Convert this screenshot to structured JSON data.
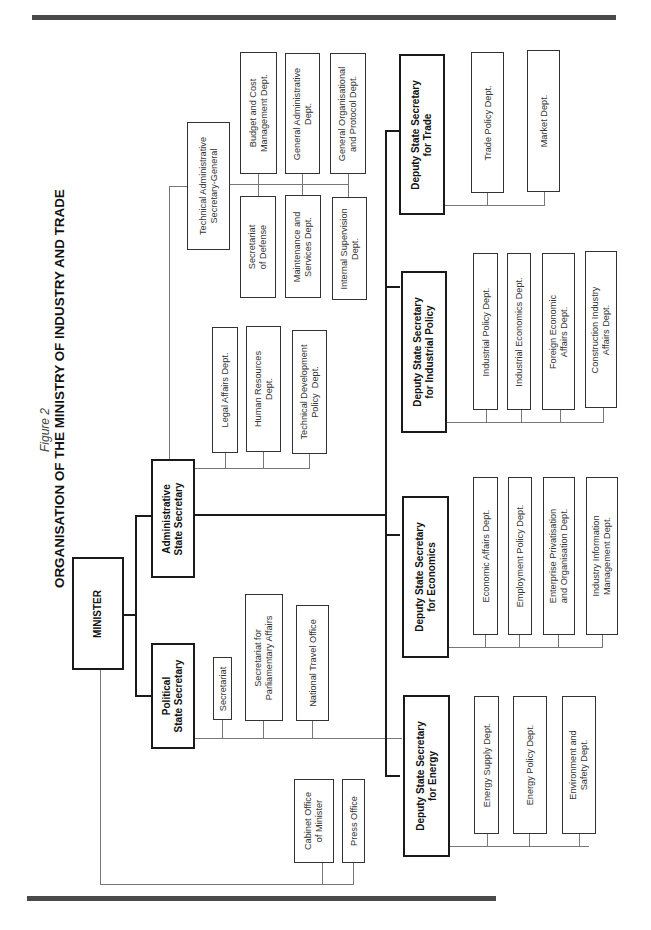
{
  "figure_label": "Figure 2",
  "title": "ORGANISATION OF THE MINISTRY OF INDUSTRY AND TRADE",
  "orientation": "rotated 90° counter-clockwise (landscape page)",
  "org": {
    "minister": "MINISTER",
    "minister_offices": [
      "Cabinet Office\nof Minister",
      "Press Office"
    ],
    "political_state_secretary": {
      "label": "Political\nState Secretary",
      "units": [
        "Secretariat",
        "Secretariat for\nParliamentary Affairs",
        "National Travel Office"
      ]
    },
    "administrative_state_secretary": {
      "label": "Administrative\nState Secretary",
      "units": [
        "Legal Affairs Dept.",
        "Human Resources\nDept.",
        "Technical Development\nPolicy  Dept."
      ],
      "technical_admin_sg": {
        "label": "Technical Administrative\nSecretary-General",
        "units_upper": [
          "Budget and Cost\nManagement Dept.",
          "General Administrative\nDept.",
          "General Organisational\nand Protocol Dept."
        ],
        "units_lower": [
          "Secretariat\nof Defense",
          "Maintenance and\nServices Dept.",
          "Internal Supervision\nDept."
        ]
      }
    },
    "deputies": [
      {
        "label": "Deputy State Secretary\nfor Trade",
        "units": [
          "Trade Policy Dept.",
          "Market Dept."
        ]
      },
      {
        "label": "Deputy State Secretary\nfor Industrial Policy",
        "units": [
          "Industrial Policy Dept.",
          "Industrial Economics Dept.",
          "Foreign Economic\nAffairs Dept.",
          "Construction Industry\nAffairs Dept."
        ]
      },
      {
        "label": "Deputy State Secretary\nfor Economics",
        "units": [
          "Economic Affairs Dept.",
          "Employment Policy Dept.",
          "Enterprise Privatisation\nand Organisation Dept.",
          "Industry Information\nManagement Dept."
        ]
      },
      {
        "label": "Deputy State Secretary\nfor Energy",
        "units": [
          "Energy Supply Dept.",
          "Energy Policy Dept.",
          "Environment and\nSafety Dept."
        ]
      }
    ]
  }
}
